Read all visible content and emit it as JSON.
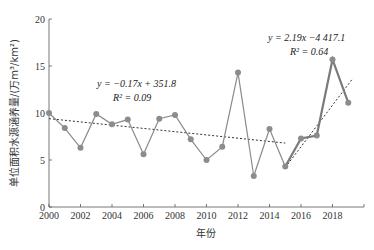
{
  "chart_data": {
    "type": "line",
    "title": "",
    "xlabel": "年份",
    "ylabel": "单位面积水源涵养量/(万m³/km²)",
    "x": [
      2000,
      2001,
      2002,
      2003,
      2004,
      2005,
      2006,
      2007,
      2008,
      2009,
      2010,
      2011,
      2012,
      2013,
      2014,
      2015,
      2016,
      2017,
      2018,
      2019
    ],
    "series": [
      {
        "name": "单位面积水源涵养量",
        "values": [
          10.0,
          8.4,
          6.3,
          9.9,
          8.8,
          9.3,
          5.6,
          9.4,
          9.8,
          7.2,
          5.0,
          6.4,
          14.3,
          3.3,
          8.3,
          4.3,
          7.3,
          7.6,
          15.7,
          11.1
        ]
      }
    ],
    "trendlines": [
      {
        "range": [
          2000,
          2015
        ],
        "equation": "y = −0.17x + 351.8",
        "r2": "R² = 0.09",
        "start_value": 9.4,
        "end_value": 6.8
      },
      {
        "range": [
          2015,
          2019.3
        ],
        "equation": "y = 2.19x −4 417.1",
        "r2": "R² = 0.64",
        "start_value": 4.2,
        "end_value": 13.7
      }
    ],
    "xticks": [
      "2000",
      "2002",
      "2004",
      "2006",
      "2008",
      "2010",
      "2012",
      "2014",
      "2016",
      "2018"
    ],
    "yticks": [
      "0",
      "5",
      "10",
      "15",
      "20"
    ],
    "xlim": [
      2000,
      2020
    ],
    "ylim": [
      0,
      20
    ],
    "grid": false,
    "legend": "none"
  },
  "labels": {
    "xlabel": "年份",
    "ylabel": "单位面积水源涵养量/(万m³/km²)",
    "eq1": "y = −0.17x + 351.8",
    "r1": "R² = 0.09",
    "eq2": "y = 2.19x −4 417.1",
    "r2": "R² = 0.64"
  },
  "colors": {
    "line": "#8a8a8a",
    "highlight_line": "#7a7a7a",
    "point": "#8c8c8c",
    "trend": "#333333",
    "axis": "#555555"
  }
}
